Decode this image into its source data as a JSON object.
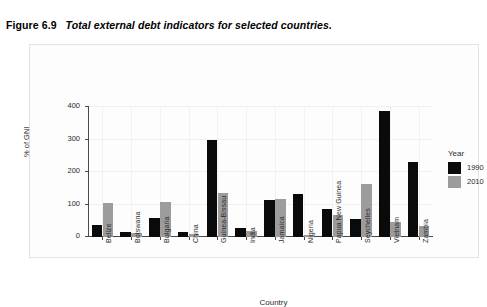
{
  "caption": {
    "figure_number": "Figure 6.9",
    "title": "Total external debt indicators for selected countries."
  },
  "legend": {
    "title": "Year",
    "entries": [
      {
        "label": "1990",
        "color": "#0a0a0a"
      },
      {
        "label": "2010",
        "color": "#9c9c9c"
      }
    ]
  },
  "chart_data": {
    "type": "bar",
    "title": "Total external debt indicators for selected countries.",
    "xlabel": "Country",
    "ylabel": "% of GNI",
    "ylim": [
      0,
      400
    ],
    "yticks": [
      0,
      100,
      200,
      300,
      400
    ],
    "grid": true,
    "legend_position": "right",
    "categories": [
      "Belize",
      "Botswana",
      "Bulgaria",
      "China",
      "Guinea-Bissau",
      "India",
      "Jamaica",
      "Nigeria",
      "Papua New Guinea",
      "Seychelles",
      "Vietnam",
      "Zambia"
    ],
    "series": [
      {
        "name": "1990",
        "color": "#0a0a0a",
        "values": [
          36,
          14,
          57,
          16,
          300,
          27,
          113,
          133,
          85,
          55,
          387,
          230
        ]
      },
      {
        "name": "2010",
        "color": "#9c9c9c",
        "values": [
          104,
          12,
          107,
          10,
          136,
          18,
          116,
          5,
          67,
          163,
          45,
          33
        ]
      }
    ]
  }
}
